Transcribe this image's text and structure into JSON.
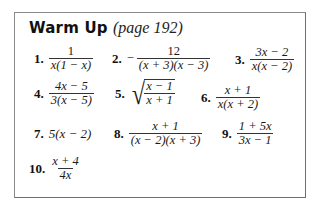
{
  "header": {
    "title": "Warm Up",
    "subtitle": "(page 192)"
  },
  "items": [
    {
      "number": "1.",
      "numerator": "1",
      "denominator": "x(1 − x)"
    },
    {
      "number": "2.",
      "sign": "−",
      "numerator": "12",
      "denominator": "(x + 3)(x − 3)"
    },
    {
      "number": "3.",
      "numerator": "3x − 2",
      "denominator": "x(x − 2)"
    },
    {
      "number": "4.",
      "numerator": "4x − 5",
      "denominator": "3(x − 5)"
    },
    {
      "number": "5.",
      "radical": "√",
      "numerator": "x − 1",
      "denominator": "x + 1"
    },
    {
      "number": "6.",
      "numerator": "x + 1",
      "denominator": "x(x + 2)"
    },
    {
      "number": "7.",
      "expression": "5(x − 2)"
    },
    {
      "number": "8.",
      "numerator": "x + 1",
      "denominator": "(x − 2)(x + 3)"
    },
    {
      "number": "9.",
      "numerator": "1 + 5x",
      "denominator": "3x − 1"
    },
    {
      "number": "10.",
      "numerator": "x + 4",
      "denominator": "4x"
    }
  ]
}
